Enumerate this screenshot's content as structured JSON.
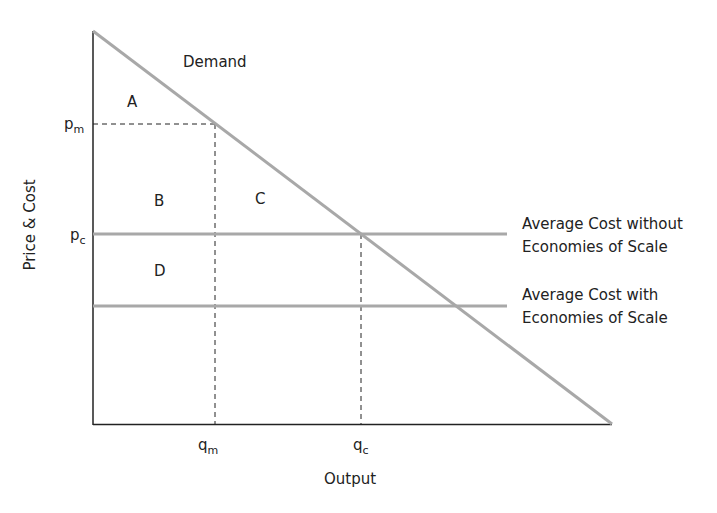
{
  "diagram": {
    "axes": {
      "y_label": "Price & Cost",
      "x_label": "Output"
    },
    "curves": {
      "demand": "Demand",
      "ac_without": [
        "Average Cost without",
        "Economies of Scale"
      ],
      "ac_with": [
        "Average Cost with",
        "Economies of Scale"
      ]
    },
    "ticks": {
      "pm": {
        "base": "p",
        "sub": "m"
      },
      "pc": {
        "base": "p",
        "sub": "c"
      },
      "qm": {
        "base": "q",
        "sub": "m"
      },
      "qc": {
        "base": "q",
        "sub": "c"
      }
    },
    "regions": [
      "A",
      "B",
      "C",
      "D"
    ],
    "colors": {
      "axis": "#222222",
      "curve": "#a8a8a8",
      "dashed": "#222222"
    }
  }
}
